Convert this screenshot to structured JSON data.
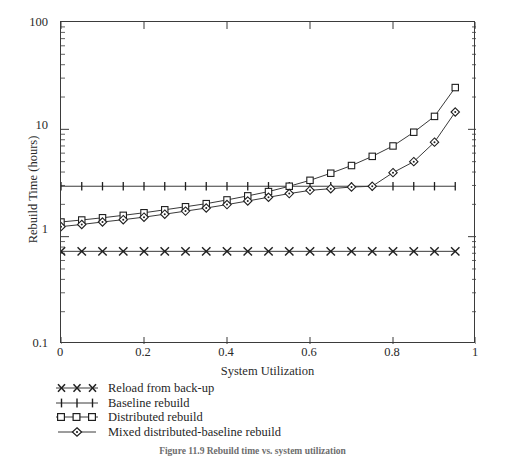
{
  "figure": {
    "caption": "Figure 11.9   Rebuild time vs. system utilization"
  },
  "chart_data": {
    "type": "line",
    "title": "",
    "xlabel": "System Utilization",
    "ylabel": "Rebuild Time (hours)",
    "xlim": [
      0,
      1
    ],
    "ylim": [
      0.1,
      100
    ],
    "yscale": "log",
    "xscale": "linear",
    "grid": false,
    "legend_position": "below-left",
    "xticks": [
      "0",
      "0.2",
      "0.4",
      "0.6",
      "0.8",
      "1"
    ],
    "xtick_values": [
      0,
      0.2,
      0.4,
      0.6,
      0.8,
      1
    ],
    "yticks": [
      "100",
      "10",
      "1",
      "0.1"
    ],
    "ytick_values": [
      100,
      10,
      1,
      0.1
    ],
    "x": [
      0,
      0.05,
      0.1,
      0.15,
      0.2,
      0.25,
      0.3,
      0.35,
      0.4,
      0.45,
      0.5,
      0.55,
      0.6,
      0.65,
      0.7,
      0.75,
      0.8,
      0.85,
      0.9,
      0.95
    ],
    "series": [
      {
        "name": "Reload from back-up",
        "marker": "x",
        "values": [
          0.73,
          0.73,
          0.73,
          0.73,
          0.73,
          0.73,
          0.73,
          0.73,
          0.73,
          0.73,
          0.73,
          0.73,
          0.73,
          0.73,
          0.73,
          0.73,
          0.73,
          0.73,
          0.73,
          0.73
        ]
      },
      {
        "name": "Baseline rebuild",
        "marker": "plus",
        "values": [
          2.95,
          2.95,
          2.95,
          2.95,
          2.95,
          2.95,
          2.95,
          2.95,
          2.95,
          2.95,
          2.95,
          2.95,
          2.95,
          2.95,
          2.95,
          2.95,
          2.95,
          2.95,
          2.95,
          2.95
        ]
      },
      {
        "name": "Distributed rebuild",
        "marker": "square",
        "values": [
          1.37,
          1.43,
          1.5,
          1.58,
          1.67,
          1.78,
          1.9,
          2.03,
          2.2,
          2.4,
          2.63,
          2.95,
          3.35,
          3.9,
          4.6,
          5.6,
          7.0,
          9.4,
          13.2,
          24.5
        ]
      },
      {
        "name": "Mixed distributed-baseline rebuild",
        "marker": "diamond",
        "values": [
          1.24,
          1.3,
          1.37,
          1.44,
          1.52,
          1.62,
          1.73,
          1.85,
          1.99,
          2.15,
          2.33,
          2.52,
          2.7,
          2.8,
          2.9,
          2.95,
          3.95,
          5.0,
          7.6,
          14.5
        ]
      }
    ]
  },
  "legend": {
    "items": [
      {
        "label": "Reload from back-up",
        "marker": "x"
      },
      {
        "label": "Baseline rebuild",
        "marker": "plus"
      },
      {
        "label": "Distributed rebuild",
        "marker": "square"
      },
      {
        "label": "Mixed distributed-baseline rebuild",
        "marker": "diamond"
      }
    ]
  },
  "colors": {
    "axis": "#3b3b3b",
    "line": "#3a3a3a",
    "text": "#1f1f1f"
  }
}
